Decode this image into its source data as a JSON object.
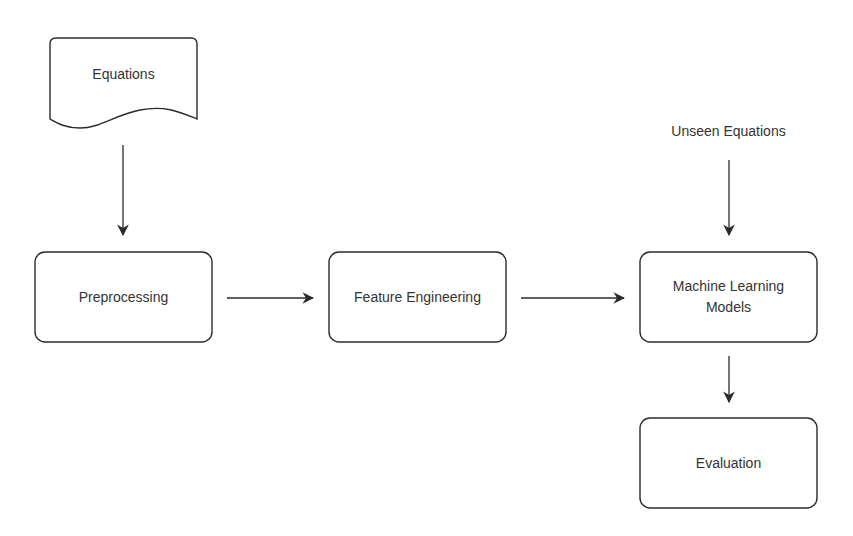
{
  "diagram": {
    "type": "flowchart",
    "nodes": [
      {
        "id": "equations",
        "label": "Equations",
        "shape": "document"
      },
      {
        "id": "preprocessing",
        "label": "Preprocessing",
        "shape": "rounded-rect"
      },
      {
        "id": "feature_engineering",
        "label": "Feature Engineering",
        "shape": "rounded-rect"
      },
      {
        "id": "ml_models",
        "label": "Machine Learning Models",
        "label_lines": [
          "Machine Learning",
          "Models"
        ],
        "shape": "rounded-rect"
      },
      {
        "id": "evaluation",
        "label": "Evaluation",
        "shape": "rounded-rect"
      },
      {
        "id": "unseen_equations",
        "label": "Unseen Equations",
        "shape": "text"
      }
    ],
    "edges": [
      {
        "from": "equations",
        "to": "preprocessing"
      },
      {
        "from": "preprocessing",
        "to": "feature_engineering"
      },
      {
        "from": "feature_engineering",
        "to": "ml_models"
      },
      {
        "from": "unseen_equations",
        "to": "ml_models"
      },
      {
        "from": "ml_models",
        "to": "evaluation"
      }
    ],
    "colors": {
      "stroke": "#2b2b2b",
      "text": "#333333",
      "background": "#ffffff"
    }
  }
}
